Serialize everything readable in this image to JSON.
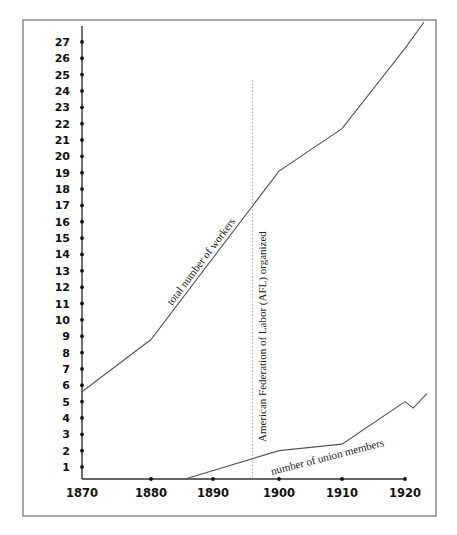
{
  "chart_data": {
    "type": "line",
    "title": "",
    "xlabel": "",
    "ylabel": "",
    "x_ticks": [
      1870,
      1880,
      1890,
      1900,
      1910,
      1920
    ],
    "y_ticks": [
      1,
      2,
      3,
      4,
      5,
      6,
      7,
      8,
      9,
      10,
      11,
      12,
      13,
      14,
      15,
      16,
      17,
      18,
      19,
      20,
      21,
      22,
      23,
      24,
      25,
      26,
      27
    ],
    "xlim": [
      1870,
      1923
    ],
    "ylim": [
      0,
      28
    ],
    "grid": false,
    "legend": null,
    "series": [
      {
        "name": "total number of workers",
        "x": [
          1870,
          1880,
          1900,
          1910,
          1920,
          1923
        ],
        "values": [
          5.6,
          8.8,
          19.1,
          21.7,
          26.6,
          28.2
        ]
      },
      {
        "name": "number of union members",
        "x": [
          1885.5,
          1900,
          1910,
          1920,
          1921.3,
          1923.5
        ],
        "values": [
          0,
          2.0,
          2.4,
          5.0,
          4.6,
          5.5
        ]
      }
    ],
    "annotations": [
      {
        "type": "vertical-dotted-line",
        "x": 1896,
        "text": "American Federation of Labor (AFL) organized"
      }
    ]
  },
  "labels": {
    "workers": "total number of workers",
    "union": "number of union members",
    "afl": "American Federation of Labor (AFL) organized"
  }
}
